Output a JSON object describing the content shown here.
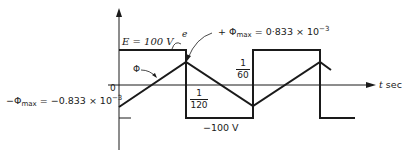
{
  "diagram": {
    "type": "waveform",
    "labels": {
      "e_level": "E = 100 V",
      "e_curve": "e",
      "phi_curve": "Φ",
      "phi_max_pos_prefix": "+ Φ",
      "phi_max_pos_sub": "max",
      "phi_max_pos_value": " = 0·833 × 10",
      "phi_max_pos_exp": "−3",
      "phi_max_neg_prefix": "−Φ",
      "phi_max_neg_sub": "max",
      "phi_max_neg_value": " = −0.833 × 10",
      "phi_max_neg_exp": "−3",
      "origin": "0",
      "neg_level": "−100 V",
      "t_axis": "t",
      "t_unit": " sec",
      "half_period_num": "1",
      "half_period_den": "120",
      "period_num": "1",
      "period_den": "60"
    },
    "colors": {
      "stroke": "#1a1a1a",
      "background": "#ffffff"
    }
  }
}
